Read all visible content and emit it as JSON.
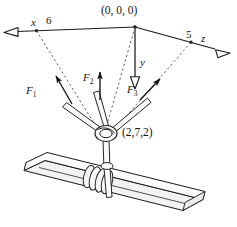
{
  "figure": {
    "type": "statics-free-body-diagram",
    "colors": {
      "ink": "#141414",
      "line": "#1a1a1a",
      "dashed": "#5a5a5a",
      "background": "#ffffff",
      "beam_fill": "#f2f2f2",
      "rope_fill": "#fafafa"
    },
    "origin_label": "(0, 0, 0)",
    "knot_point_label": "(2,7,2)",
    "axes": [
      {
        "name": "x-axis",
        "label": "x",
        "tick_value": "6",
        "direction": "upper-left",
        "arrow": "hollow"
      },
      {
        "name": "y-axis",
        "label": "y",
        "tick_value": "",
        "direction": "down",
        "arrow": "hollow"
      },
      {
        "name": "z-axis",
        "label": "z",
        "tick_value": "5",
        "direction": "lower-right",
        "arrow": "hollow"
      }
    ],
    "forces": [
      {
        "name": "force-1",
        "label": "F",
        "subscript": "1",
        "direction": "up-left",
        "arrow": "solid"
      },
      {
        "name": "force-2",
        "label": "F",
        "subscript": "2",
        "direction": "up",
        "arrow": "solid"
      },
      {
        "name": "force-3",
        "label": "F",
        "subscript": "3",
        "direction": "up-right",
        "arrow": "solid"
      }
    ],
    "annotations": {
      "origin": "(0, 0, 0)",
      "knot": "(2,7,2)",
      "x_tick": "6",
      "z_tick": "5",
      "x_axis": "x",
      "y_axis": "y",
      "z_axis": "z",
      "f1": "F",
      "f1_sub": "1",
      "f2": "F",
      "f2_sub": "2",
      "f3": "F",
      "f3_sub": "3"
    }
  }
}
